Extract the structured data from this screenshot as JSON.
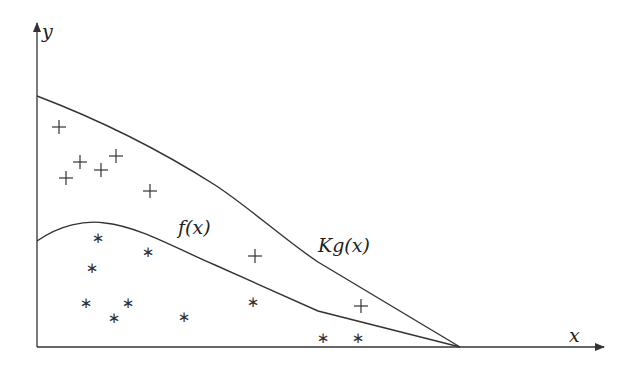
{
  "diagram": {
    "axes": {
      "x_label": "x",
      "y_label": "y",
      "origin": [
        37,
        347
      ],
      "x_end": [
        604,
        347
      ],
      "y_end": [
        37,
        23
      ]
    },
    "curves": [
      {
        "name": "Kg(x)",
        "label": "Kg(x)",
        "label_pos": [
          318,
          236
        ],
        "path": "M37,96 C100,120 160,150 215,185 C250,208 285,240 318,262 L460,347"
      },
      {
        "name": "f(x)",
        "label": "f(x)",
        "label_pos": [
          178,
          218
        ],
        "path": "M37,241 C60,225 85,220 105,223 C140,227 175,248 215,265 L318,311 L460,347"
      }
    ],
    "plus_points": [
      [
        59,
        127
      ],
      [
        66,
        178
      ],
      [
        80,
        162
      ],
      [
        101,
        170
      ],
      [
        116,
        156
      ],
      [
        150,
        191
      ],
      [
        255,
        256
      ],
      [
        361,
        306
      ]
    ],
    "star_points": [
      [
        98,
        237
      ],
      [
        92,
        267
      ],
      [
        148,
        251
      ],
      [
        86,
        302
      ],
      [
        114,
        317
      ],
      [
        128,
        302
      ],
      [
        184,
        316
      ],
      [
        253,
        301
      ],
      [
        323,
        337
      ],
      [
        358,
        337
      ]
    ],
    "stroke_color": "#333333"
  }
}
